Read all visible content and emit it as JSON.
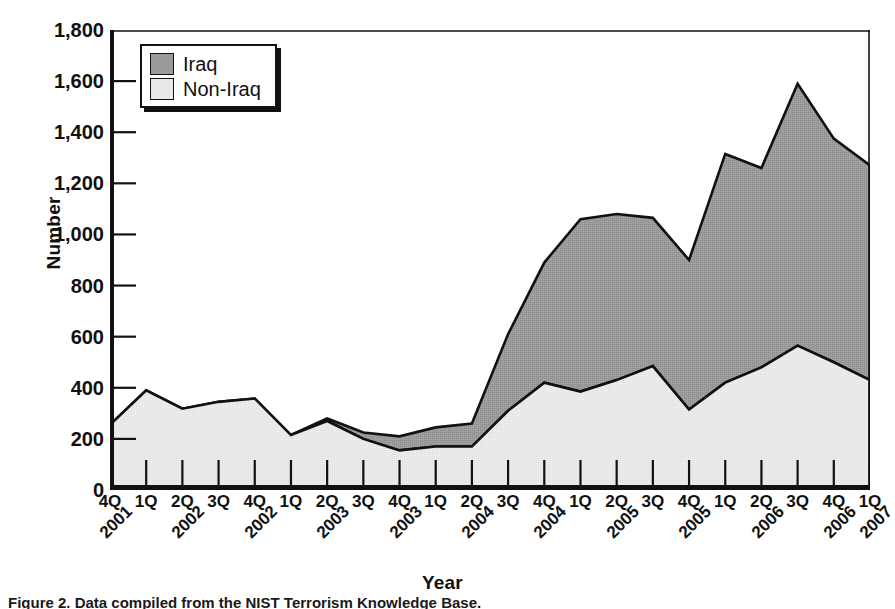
{
  "chart_data": {
    "type": "area",
    "stacked": true,
    "title": "",
    "xlabel": "Year",
    "ylabel": "Number",
    "ylim": [
      0,
      1800
    ],
    "ytick_step": 200,
    "ytick_labels": [
      "1,800",
      "1,600",
      "1,400",
      "1,200",
      "1,000",
      "800",
      "600",
      "400",
      "200",
      "0"
    ],
    "ytick_values": [
      1800,
      1600,
      1400,
      1200,
      1000,
      800,
      600,
      400,
      200,
      0
    ],
    "grid": false,
    "legend_position": "top-left",
    "categories": [
      "4Q 2001",
      "1Q 2002",
      "2Q 2002",
      "3Q 2002",
      "4Q 2002",
      "1Q 2003",
      "2Q 2003",
      "3Q 2003",
      "4Q 2003",
      "1Q 2004",
      "2Q 2004",
      "3Q 2004",
      "4Q 2004",
      "1Q 2005",
      "2Q 2005",
      "3Q 2005",
      "4Q 2005",
      "1Q 2006",
      "2Q 2006",
      "3Q 2006",
      "4Q 2006",
      "1Q 2007"
    ],
    "xtick_quarters": [
      "4Q",
      "1Q",
      "2Q",
      "3Q",
      "4Q",
      "1Q",
      "2Q",
      "3Q",
      "4Q",
      "1Q",
      "2Q",
      "3Q",
      "4Q",
      "1Q",
      "2Q",
      "3Q",
      "4Q",
      "1Q",
      "2Q",
      "3Q",
      "4Q",
      "1Q"
    ],
    "xtick_years": [
      "2001",
      "",
      "2002",
      "",
      "2002",
      "",
      "2003",
      "",
      "2003",
      "",
      "2004",
      "",
      "2004",
      "",
      "2005",
      "",
      "2005",
      "",
      "2006",
      "",
      "2006",
      "2007"
    ],
    "series": [
      {
        "name": "Non-Iraq",
        "color": "#e9e9e9",
        "values": [
          255,
          390,
          318,
          345,
          358,
          215,
          270,
          200,
          155,
          170,
          170,
          310,
          420,
          385,
          430,
          485,
          315,
          420,
          480,
          565,
          500,
          430
        ]
      },
      {
        "name": "Iraq",
        "color": "#9a9a9a",
        "values": [
          0,
          0,
          0,
          0,
          0,
          0,
          10,
          25,
          55,
          75,
          90,
          300,
          470,
          675,
          650,
          580,
          585,
          895,
          780,
          1025,
          875,
          840
        ]
      }
    ],
    "totals": [
      255,
      390,
      318,
      345,
      358,
      215,
      280,
      225,
      210,
      245,
      260,
      610,
      890,
      1060,
      1080,
      1065,
      900,
      1315,
      1260,
      1590,
      1375,
      1270
    ]
  },
  "legend": {
    "items": [
      {
        "label": "Iraq",
        "color": "#9a9a9a"
      },
      {
        "label": "Non-Iraq",
        "color": "#e9e9e9"
      }
    ]
  },
  "axes": {
    "y_title": "Number",
    "x_title": "Year"
  },
  "caption": {
    "text": "Figure 2. Data compiled from the NIST Terrorism Knowledge Base."
  }
}
